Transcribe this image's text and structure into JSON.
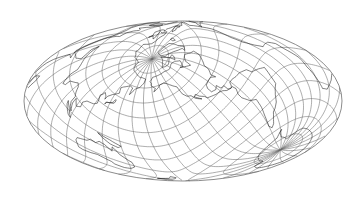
{
  "map": {
    "title": "World map – oblique Hammer-Aitoff projection with graticule",
    "projection": "oblique hammer",
    "colors": {
      "background": "#ffffff",
      "graticule": "#6a6a6a",
      "coastline": "#1a1a1a",
      "outline": "#5a5a5a"
    },
    "frame": {
      "cx": 183,
      "cy": 101,
      "rx": 159,
      "ry": 80
    },
    "pole_position": {
      "lon": -40.5,
      "lat": 43,
      "roll": 180
    },
    "graticule_step_deg": 15,
    "north_pole_screen": [
      152,
      59
    ],
    "south_pole_screen": [
      285,
      147
    ]
  }
}
